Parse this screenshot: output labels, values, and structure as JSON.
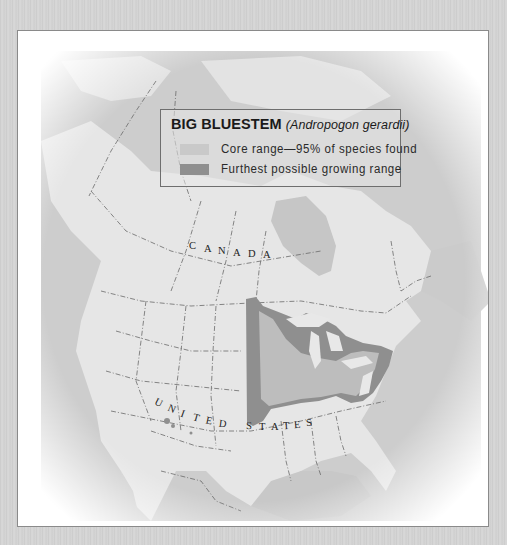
{
  "legend": {
    "title": "BIG BLUESTEM",
    "scientific_name": "(Andropogon gerardii)",
    "items": [
      {
        "label": "Core range—95% of species found",
        "color": "#bdbdbd"
      },
      {
        "label": "Furthest possible growing range",
        "color": "#8f8f8f"
      }
    ]
  },
  "map": {
    "labels": {
      "canada": [
        "C",
        "A",
        "N",
        "A",
        "D",
        "A"
      ],
      "united_states": [
        "U",
        "N",
        "I",
        "T",
        "E",
        "D",
        "S",
        "T",
        "A",
        "T",
        "E",
        "S"
      ]
    },
    "colors": {
      "land": "#e6e6e6",
      "water": "#c4c4c4",
      "core_range": "#bdbdbd",
      "furthest_range": "#8f8f8f",
      "border": "#6a6a6a"
    }
  }
}
